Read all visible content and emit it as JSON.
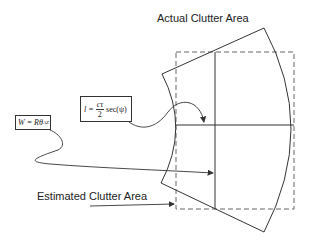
{
  "labels": {
    "actual": "Actual Clutter Area",
    "estimated": "Estimated Clutter Area"
  },
  "formulas": {
    "length": {
      "lhs": "l =",
      "numerator": "cτ",
      "denominator": "2",
      "rhs": "sec(ψ)"
    },
    "width": {
      "text": "W = Rθ",
      "subscript": "AZ"
    }
  },
  "colors": {
    "line": "#333333",
    "dashed": "#666666",
    "background": "#ffffff"
  }
}
